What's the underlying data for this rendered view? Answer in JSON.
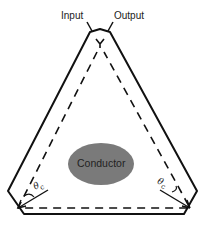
{
  "labels": {
    "input": "Input",
    "output": "Output",
    "conductor": "Conductor",
    "angle_symbol": "θ",
    "angle_subscript": "c"
  },
  "colors": {
    "stroke": "#111111",
    "conductor_fill": "#7a7a7a",
    "background": "#ffffff"
  }
}
